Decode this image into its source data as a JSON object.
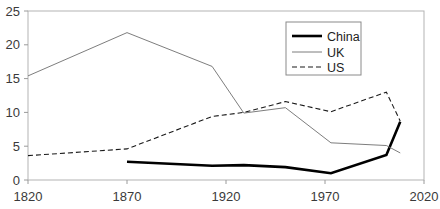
{
  "chart_data": {
    "type": "line",
    "title": "",
    "subtitle": "",
    "xlabel": "",
    "ylabel": "",
    "xlim": [
      1820,
      2020
    ],
    "ylim": [
      0,
      25
    ],
    "grid": false,
    "legend_position": "top-right",
    "xticks": [
      "1820",
      "1870",
      "1920",
      "1970",
      "2020"
    ],
    "xtick_values": [
      1820,
      1870,
      1920,
      1970,
      2020
    ],
    "yticks": [
      "0",
      "5",
      "10",
      "15",
      "20",
      "25"
    ],
    "ytick_values": [
      0,
      5,
      10,
      15,
      20,
      25
    ],
    "series": [
      {
        "name": "China",
        "style": "solid-thick",
        "color": "#000000",
        "width": 2.6,
        "x": [
          1870,
          1913,
          1929,
          1950,
          1973,
          2001,
          2008
        ],
        "values": [
          2.7,
          2.1,
          2.2,
          1.9,
          1.0,
          3.7,
          8.6
        ]
      },
      {
        "name": "UK",
        "style": "solid-thin",
        "color": "#6e6e6e",
        "width": 0.9,
        "x": [
          1820,
          1870,
          1913,
          1929,
          1950,
          1973,
          2001,
          2008
        ],
        "values": [
          15.4,
          21.8,
          16.8,
          9.9,
          10.7,
          5.5,
          5.1,
          4.0
        ]
      },
      {
        "name": "US",
        "style": "dashed",
        "color": "#1a1a1a",
        "width": 1.1,
        "x": [
          1820,
          1870,
          1913,
          1929,
          1950,
          1973,
          2001,
          2008
        ],
        "values": [
          3.6,
          4.6,
          9.4,
          10.0,
          11.6,
          10.1,
          13.0,
          8.7
        ]
      }
    ]
  },
  "legend": {
    "entries": [
      {
        "label": "China"
      },
      {
        "label": "UK"
      },
      {
        "label": "US"
      }
    ]
  }
}
